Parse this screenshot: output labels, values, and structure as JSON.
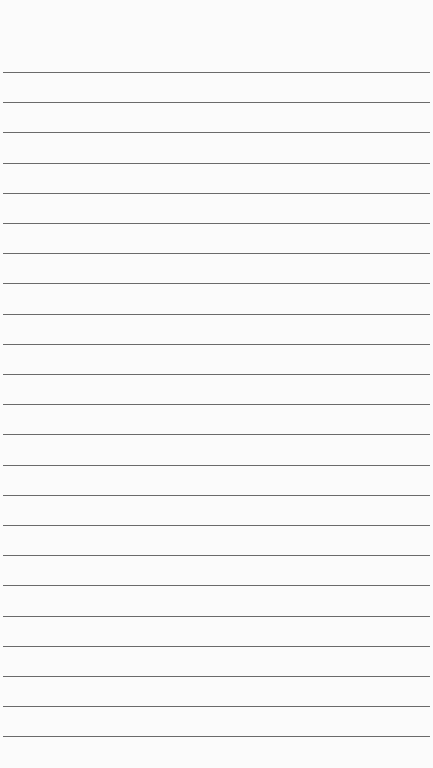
{
  "paper": {
    "line_color": "#6a6a6a",
    "background": "#fbfbfb",
    "first_line_y": 72,
    "line_spacing": 30.2,
    "line_count": 23
  }
}
